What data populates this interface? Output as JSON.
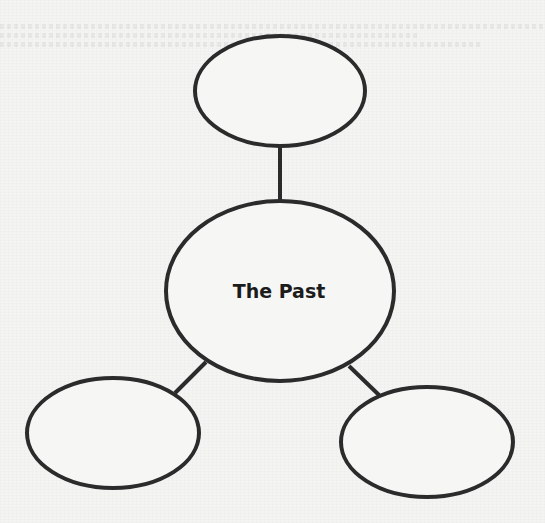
{
  "diagram": {
    "type": "web-organizer",
    "center": {
      "label": "The Past"
    },
    "branches": [
      {
        "id": "top",
        "label": ""
      },
      {
        "id": "bottom-left",
        "label": ""
      },
      {
        "id": "bottom-right",
        "label": ""
      }
    ]
  },
  "colors": {
    "stroke": "#2b2b2b",
    "background": "#f4f4f3",
    "text": "#1c1c1c"
  }
}
